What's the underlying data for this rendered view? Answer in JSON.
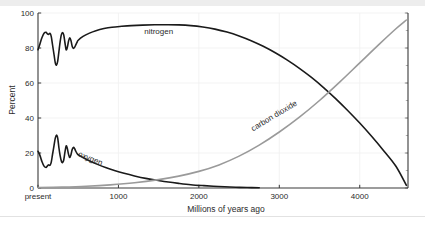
{
  "figure": {
    "background_color": "#ffffff",
    "top_strip_color": "#ededed",
    "bottom_rule_color": "#e2e2e2"
  },
  "chart_data": {
    "type": "line",
    "title": "",
    "xlabel": "Millions of years ago",
    "ylabel": "Percent",
    "xlim": [
      0,
      4600
    ],
    "ylim": [
      0,
      100
    ],
    "grid": true,
    "grid_color": "#f0f0f0",
    "legend_position": "inline-annotations",
    "x_tick_values": [
      0,
      1000,
      2000,
      3000,
      4000
    ],
    "x_tick_labels": [
      "present",
      "1000",
      "2000",
      "3000",
      "4000"
    ],
    "y_tick_values": [
      0,
      20,
      40,
      60,
      80,
      100
    ],
    "y_tick_labels": [
      "0",
      "20",
      "40",
      "60",
      "80",
      "100"
    ],
    "axis_color": "#3a3a3a",
    "series": [
      {
        "name": "nitrogen",
        "label": "nitrogen",
        "color": "#1a1a1a",
        "width": 1.6,
        "label_x": 1500,
        "label_y": 88,
        "label_rotation": 0,
        "x": [
          0,
          25,
          50,
          75,
          100,
          115,
          130,
          150,
          165,
          180,
          200,
          215,
          230,
          245,
          260,
          275,
          290,
          305,
          320,
          335,
          350,
          365,
          380,
          395,
          410,
          425,
          440,
          455,
          470,
          485,
          500,
          560,
          640,
          720,
          820,
          920,
          1040,
          1160,
          1300,
          1450,
          1600,
          1750,
          1900,
          2050,
          2200,
          2350,
          2500,
          2650,
          2800,
          2950,
          3100,
          3250,
          3400,
          3550,
          3700,
          3850,
          4000,
          4150,
          4300,
          4450,
          4580
        ],
        "y": [
          79,
          82.5,
          86,
          88.4,
          89,
          88.2,
          87.8,
          88.3,
          86.5,
          82,
          76,
          71.5,
          70.2,
          72.5,
          78,
          83.5,
          87.5,
          88.8,
          87.5,
          83,
          79,
          80.5,
          84,
          85.8,
          84.2,
          81,
          79.8,
          80.4,
          81.8,
          83.2,
          84.4,
          86.6,
          88.5,
          89.9,
          91.1,
          91.9,
          92.4,
          92.8,
          93.1,
          93.3,
          93.3,
          93.2,
          92.8,
          92,
          90.8,
          89.1,
          86.9,
          84.2,
          81,
          77.3,
          73.1,
          68.4,
          63.2,
          57.4,
          51.1,
          44.3,
          37.1,
          29.4,
          21.2,
          12.4,
          1.5
        ]
      },
      {
        "name": "oxygen",
        "label": "oxygen",
        "color": "#1a1a1a",
        "width": 1.6,
        "label_x": 640,
        "label_y": 15.5,
        "label_rotation": 22,
        "x": [
          0,
          25,
          50,
          75,
          100,
          115,
          130,
          150,
          165,
          180,
          200,
          215,
          230,
          245,
          260,
          275,
          290,
          305,
          320,
          335,
          350,
          365,
          380,
          395,
          410,
          425,
          440,
          455,
          470,
          485,
          500,
          570,
          650,
          740,
          840,
          950,
          1070,
          1200,
          1340,
          1480,
          1620,
          1760,
          1900,
          2040,
          2180,
          2320,
          2460,
          2600,
          2750
        ],
        "y": [
          21,
          18.5,
          15,
          12.5,
          11.7,
          12.5,
          13.2,
          13,
          14.8,
          19,
          24.5,
          28.5,
          30.2,
          28.5,
          23,
          18.5,
          15.5,
          14.5,
          16,
          20.5,
          24,
          22.5,
          19.2,
          17.4,
          19,
          22,
          23.2,
          22.5,
          21,
          19.8,
          19,
          17.1,
          15.3,
          13.5,
          11.7,
          10,
          8.4,
          6.9,
          5.5,
          4.4,
          3.4,
          2.6,
          1.9,
          1.4,
          1.0,
          0.7,
          0.45,
          0.25,
          0.1
        ]
      },
      {
        "name": "carbon dioxide",
        "label": "carbon dioxide",
        "color": "#9a9a9a",
        "width": 1.6,
        "label_x": 2950,
        "label_y": 40,
        "label_rotation": -31,
        "x": [
          0,
          300,
          600,
          900,
          1200,
          1500,
          1750,
          2000,
          2250,
          2500,
          2750,
          3000,
          3250,
          3500,
          3750,
          4000,
          4250,
          4450,
          4580
        ],
        "y": [
          0.2,
          0.5,
          1.0,
          1.8,
          3.0,
          4.8,
          6.8,
          9.5,
          13.2,
          18.2,
          24.5,
          32.0,
          40.5,
          50.0,
          60.5,
          71.5,
          82.5,
          91.0,
          96.0
        ]
      }
    ]
  }
}
